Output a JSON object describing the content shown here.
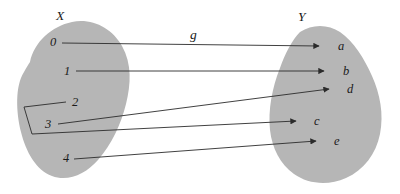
{
  "diagram": {
    "type": "function-mapping-diagram",
    "function_label": "g",
    "domain_set": {
      "name": "X",
      "label_x": 58,
      "label_y": 10
    },
    "codomain_set": {
      "name": "Y",
      "label_x": 300,
      "label_y": 11
    },
    "colors": {
      "background": "#ffffff",
      "blob_fill": "#b6b6b6",
      "line": "#2b2b2b",
      "text": "#1a1a1a"
    },
    "domain_elements": [
      {
        "label": "0",
        "x": 50,
        "y": 36
      },
      {
        "label": "1",
        "x": 64,
        "y": 65
      },
      {
        "label": "2",
        "x": 72,
        "y": 97
      },
      {
        "label": "3",
        "x": 45,
        "y": 118
      },
      {
        "label": "4",
        "x": 63,
        "y": 152
      }
    ],
    "codomain_elements": [
      {
        "label": "a",
        "x": 339,
        "y": 40
      },
      {
        "label": "b",
        "x": 344,
        "y": 65
      },
      {
        "label": "d",
        "x": 348,
        "y": 84
      },
      {
        "label": "c",
        "x": 315,
        "y": 116
      },
      {
        "label": "e",
        "x": 335,
        "y": 136
      }
    ],
    "mappings": [
      {
        "from": "0",
        "to": "a"
      },
      {
        "from": "1",
        "to": "b"
      },
      {
        "from": "2",
        "to": "c"
      },
      {
        "from": "3",
        "to": "d"
      },
      {
        "from": "4",
        "to": "e"
      }
    ],
    "function_label_position": {
      "x": 190,
      "y": 28
    }
  }
}
